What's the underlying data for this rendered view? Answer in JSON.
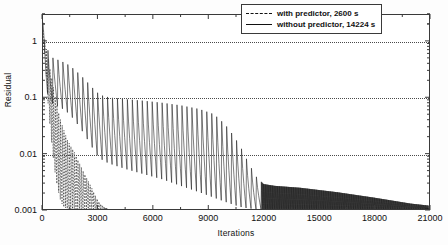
{
  "chart_data": {
    "type": "line",
    "title": "",
    "xlabel": "Iterations",
    "ylabel": "Residual",
    "yscale": "log",
    "xlim": [
      0,
      21000
    ],
    "ylim": [
      0.001,
      3
    ],
    "grid": true,
    "legend_position": "top-right",
    "x_ticks": [
      {
        "value": 0,
        "label": "0"
      },
      {
        "value": 3000,
        "label": "3000"
      },
      {
        "value": 6000,
        "label": "6000"
      },
      {
        "value": 9000,
        "label": "9000"
      },
      {
        "value": 12000,
        "label": "12000"
      },
      {
        "value": 15000,
        "label": "15000"
      },
      {
        "value": 18000,
        "label": "18000"
      },
      {
        "value": 21000,
        "label": "21000"
      }
    ],
    "y_ticks": [
      {
        "value": 1,
        "label": "1"
      },
      {
        "value": 0.1,
        "label": "0.1"
      },
      {
        "value": 0.01,
        "label": "0.01"
      },
      {
        "value": 0.001,
        "label": "0.001"
      }
    ],
    "series": [
      {
        "name": "with predictor, 2600 s",
        "style": "dashed",
        "color": "#111111",
        "description": "Oscillating residual decaying rapidly from ~1 to 0.001 converged by about 3400 iterations",
        "envelope_upper": [
          [
            0,
            1.6
          ],
          [
            120,
            1.0
          ],
          [
            300,
            0.45
          ],
          [
            500,
            0.2
          ],
          [
            700,
            0.09
          ],
          [
            900,
            0.045
          ],
          [
            1100,
            0.028
          ],
          [
            1300,
            0.018
          ],
          [
            1500,
            0.0135
          ],
          [
            1700,
            0.0105
          ],
          [
            1900,
            0.0075
          ],
          [
            2100,
            0.0055
          ],
          [
            2300,
            0.004
          ],
          [
            2500,
            0.003
          ],
          [
            2700,
            0.0022
          ],
          [
            2900,
            0.0016
          ],
          [
            3100,
            0.00125
          ],
          [
            3400,
            0.00105
          ],
          [
            3500,
            0.001
          ]
        ],
        "envelope_lower": [
          [
            0,
            1.2
          ],
          [
            120,
            0.5
          ],
          [
            300,
            0.06
          ],
          [
            500,
            0.012
          ],
          [
            700,
            0.0035
          ],
          [
            900,
            0.0016
          ],
          [
            1100,
            0.0011
          ],
          [
            1300,
            0.00102
          ],
          [
            1500,
            0.001
          ],
          [
            1900,
            0.001
          ],
          [
            2500,
            0.001
          ],
          [
            3100,
            0.001
          ],
          [
            3500,
            0.001
          ]
        ],
        "oscillation_period": 95,
        "x_end": 3500
      },
      {
        "name": "without predictor, 14224 s",
        "style": "solid",
        "color": "#111111",
        "description": "Oscillating residual with slowly decaying sawtooth envelope from ~1 down to 0.001, dense high-frequency band after ~12000 iterations",
        "envelope_upper": [
          [
            0,
            2.2
          ],
          [
            150,
            1.0
          ],
          [
            350,
            0.55
          ],
          [
            600,
            0.5
          ],
          [
            900,
            0.46
          ],
          [
            1300,
            0.4
          ],
          [
            1700,
            0.32
          ],
          [
            2100,
            0.24
          ],
          [
            2500,
            0.175
          ],
          [
            2900,
            0.125
          ],
          [
            3300,
            0.105
          ],
          [
            3800,
            0.098
          ],
          [
            4500,
            0.093
          ],
          [
            5500,
            0.087
          ],
          [
            6500,
            0.08
          ],
          [
            7500,
            0.072
          ],
          [
            8500,
            0.062
          ],
          [
            9300,
            0.05
          ],
          [
            9900,
            0.033
          ],
          [
            10400,
            0.02
          ],
          [
            10800,
            0.012
          ],
          [
            11200,
            0.0065
          ],
          [
            11600,
            0.0038
          ],
          [
            12000,
            0.0028
          ],
          [
            12600,
            0.0026
          ],
          [
            14000,
            0.0024
          ],
          [
            16000,
            0.002
          ],
          [
            18000,
            0.0016
          ],
          [
            20000,
            0.00125
          ],
          [
            21000,
            0.00115
          ]
        ],
        "envelope_lower": [
          [
            0,
            0.9
          ],
          [
            150,
            0.16
          ],
          [
            350,
            0.085
          ],
          [
            600,
            0.075
          ],
          [
            900,
            0.068
          ],
          [
            1300,
            0.055
          ],
          [
            1700,
            0.04
          ],
          [
            2100,
            0.026
          ],
          [
            2500,
            0.016
          ],
          [
            2900,
            0.0095
          ],
          [
            3300,
            0.0072
          ],
          [
            3800,
            0.0062
          ],
          [
            4500,
            0.0052
          ],
          [
            5500,
            0.0042
          ],
          [
            6500,
            0.0034
          ],
          [
            7500,
            0.0026
          ],
          [
            8500,
            0.002
          ],
          [
            9300,
            0.0016
          ],
          [
            9900,
            0.00135
          ],
          [
            10400,
            0.00118
          ],
          [
            10800,
            0.00108
          ],
          [
            11200,
            0.00102
          ],
          [
            11600,
            0.001
          ],
          [
            12000,
            0.001
          ],
          [
            14000,
            0.001
          ],
          [
            16000,
            0.001
          ],
          [
            18000,
            0.001
          ],
          [
            20000,
            0.001
          ],
          [
            21000,
            0.001
          ]
        ],
        "oscillation_period": 270,
        "dense_from": 11700,
        "dense_period": 38,
        "x_end": 21000
      }
    ]
  },
  "legend": {
    "entries": [
      {
        "label": "with predictor, 2600 s",
        "style": "dashed"
      },
      {
        "label": "without predictor, 14224 s",
        "style": "solid"
      }
    ]
  }
}
